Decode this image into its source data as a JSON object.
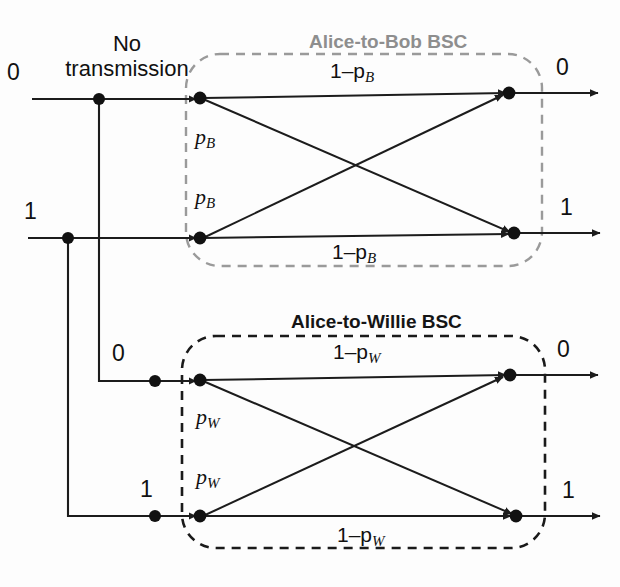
{
  "figure": {
    "type": "diagram",
    "annotations": {
      "no_transmission": "No\ntransmission",
      "no_transmission_line1": "No",
      "no_transmission_line2": "transmission"
    },
    "channels": [
      {
        "id": "alice-to-bob",
        "title": "Alice-to-Bob BSC",
        "title_color": "#8e8e8e",
        "border_style": "dashed",
        "border_color": "#9a9a9a",
        "inputs": [
          "0",
          "1"
        ],
        "outputs": [
          "0",
          "1"
        ],
        "transitions": [
          {
            "from": "0",
            "to": "0",
            "label_prefix": "1–",
            "label_symbol": "p",
            "label_sub": "B",
            "label_text": "1–p_B"
          },
          {
            "from": "0",
            "to": "1",
            "label_prefix": "",
            "label_symbol": "p",
            "label_sub": "B",
            "label_text": "p_B"
          },
          {
            "from": "1",
            "to": "0",
            "label_prefix": "",
            "label_symbol": "p",
            "label_sub": "B",
            "label_text": "p_B"
          },
          {
            "from": "1",
            "to": "1",
            "label_prefix": "1–",
            "label_symbol": "p",
            "label_sub": "B",
            "label_text": "1–p_B"
          }
        ]
      },
      {
        "id": "alice-to-willie",
        "title": "Alice-to-Willie BSC",
        "title_color": "#151515",
        "border_style": "dashed",
        "border_color": "#1a1a1a",
        "inputs": [
          "0",
          "1"
        ],
        "outputs": [
          "0",
          "1"
        ],
        "transitions": [
          {
            "from": "0",
            "to": "0",
            "label_prefix": "1–",
            "label_symbol": "p",
            "label_sub": "W",
            "label_text": "1–p_W"
          },
          {
            "from": "0",
            "to": "1",
            "label_prefix": "",
            "label_symbol": "p",
            "label_sub": "W",
            "label_text": "p_W"
          },
          {
            "from": "1",
            "to": "0",
            "label_prefix": "",
            "label_symbol": "p",
            "label_sub": "W",
            "label_text": "p_W"
          },
          {
            "from": "1",
            "to": "1",
            "label_prefix": "1–",
            "label_symbol": "p",
            "label_sub": "W",
            "label_text": "1–p_W"
          }
        ]
      }
    ],
    "labels": {
      "bob_input_0": "0",
      "bob_input_1": "1",
      "bob_output_0": "0",
      "bob_output_1": "1",
      "willie_input_0": "0",
      "willie_input_1": "1",
      "willie_output_0": "0",
      "willie_output_1": "1",
      "bob_p00": "1–p",
      "bob_p00_sub": "B",
      "bob_p01": "p",
      "bob_p01_sub": "B",
      "bob_p10": "p",
      "bob_p10_sub": "B",
      "bob_p11": "1–p",
      "bob_p11_sub": "B",
      "willie_p00": "1–p",
      "willie_p00_sub": "W",
      "willie_p01": "p",
      "willie_p01_sub": "W",
      "willie_p10": "p",
      "willie_p10_sub": "W",
      "willie_p11": "1–p",
      "willie_p11_sub": "W"
    },
    "colors": {
      "line": "#1c1c1c",
      "bob_box": "#9a9a9a",
      "willie_box": "#1a1a1a",
      "background": "#fdfdfd"
    }
  }
}
